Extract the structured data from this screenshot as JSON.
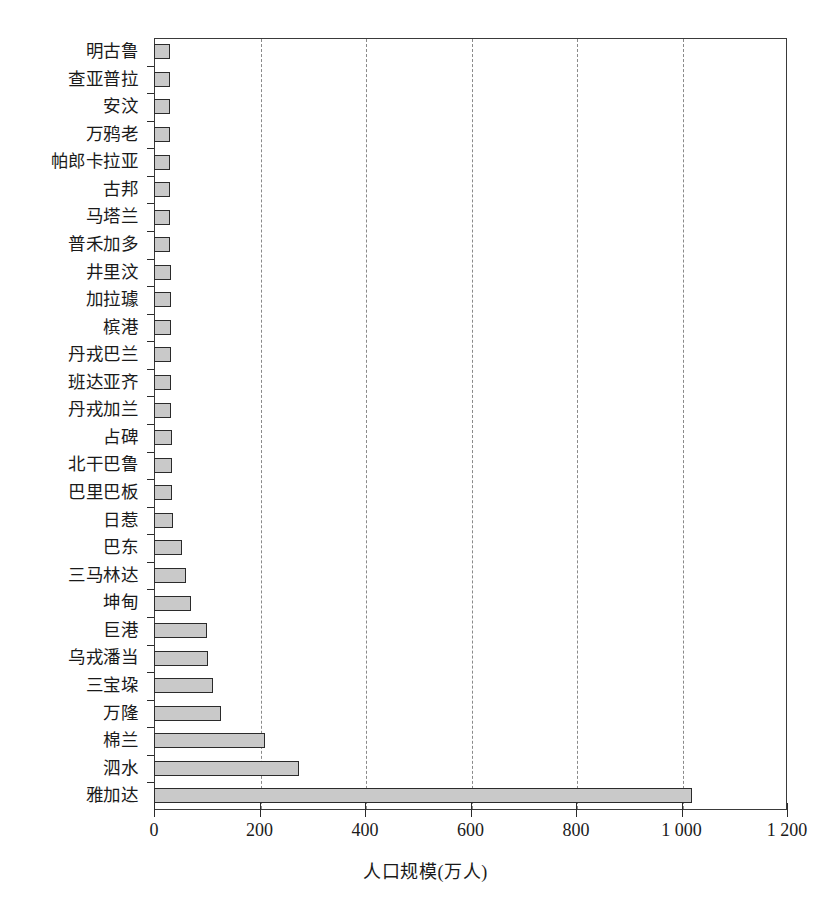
{
  "chart_data": {
    "type": "bar",
    "orientation": "horizontal",
    "title": "",
    "xlabel": "人口规模(万人)",
    "ylabel": "",
    "xlim": [
      0,
      1200
    ],
    "xticks": [
      0,
      200,
      400,
      600,
      800,
      1000,
      1200
    ],
    "xtick_labels": [
      "0",
      "200",
      "400",
      "600",
      "800",
      "1 000",
      "1 200"
    ],
    "grid": "vertical-dashed",
    "legend": "none",
    "bar_fill_color": "#c9c9c9",
    "bar_edge_color": "#2b2b2b",
    "categories": [
      "明古鲁",
      "查亚普拉",
      "安汶",
      "万鸦老",
      "帕郎卡拉亚",
      "古邦",
      "马塔兰",
      "普禾加多",
      "井里汶",
      "加拉璩",
      "槟港",
      "丹戎巴兰",
      "班达亚齐",
      "丹戎加兰",
      "占碑",
      "北干巴鲁",
      "巴里巴板",
      "日惹",
      "巴东",
      "三马林达",
      "坤甸",
      "巨港",
      "乌戎潘当",
      "三宝垜",
      "万隆",
      "棉兰",
      "泗水",
      "雅加达"
    ],
    "values": [
      31,
      31,
      31,
      31,
      31,
      31,
      31,
      31,
      32,
      32,
      33,
      33,
      33,
      33,
      34,
      34,
      35,
      36,
      53,
      61,
      70,
      100,
      103,
      112,
      127,
      210,
      275,
      1020
    ]
  }
}
